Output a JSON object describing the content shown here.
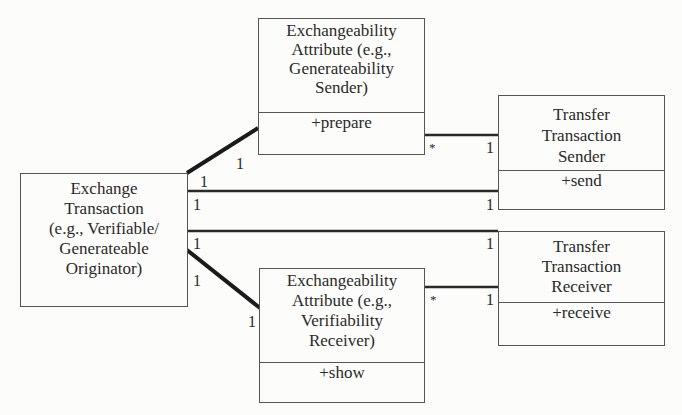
{
  "diagram": {
    "type": "uml-class",
    "classes": [
      {
        "id": "exchange_transaction",
        "name": "Exchange\nTransaction\n(e.g., Verifiable/\nGenerateable\nOriginator)",
        "operations": []
      },
      {
        "id": "attr_sender",
        "name": "Exchangeability\nAttribute (e.g.,\nGenerateability\nSender)",
        "operations": [
          "+prepare"
        ]
      },
      {
        "id": "tt_sender",
        "name": "Transfer\nTransaction\nSender",
        "operations": [
          "+send"
        ]
      },
      {
        "id": "attr_receiver",
        "name": "Exchangeability\nAttribute (e.g.,\nVerifiability\nReceiver)",
        "operations": [
          "+show"
        ]
      },
      {
        "id": "tt_receiver",
        "name": "Transfer\nTransaction\nReceiver",
        "operations": [
          "+receive"
        ]
      }
    ],
    "associations": [
      {
        "from": "exchange_transaction",
        "to": "attr_sender",
        "from_mult": "1",
        "to_mult": "1",
        "style": "thick"
      },
      {
        "from": "exchange_transaction",
        "to": "tt_sender",
        "from_mult": "1",
        "to_mult": "1",
        "style": "normal"
      },
      {
        "from": "exchange_transaction",
        "to": "tt_receiver",
        "from_mult": "1",
        "to_mult": "1",
        "style": "normal"
      },
      {
        "from": "exchange_transaction",
        "to": "attr_receiver",
        "from_mult": "1",
        "to_mult": "1",
        "style": "thick"
      },
      {
        "from": "attr_sender",
        "to": "tt_sender",
        "from_mult": "*",
        "to_mult": "1",
        "style": "normal"
      },
      {
        "from": "attr_receiver",
        "to": "tt_receiver",
        "from_mult": "*",
        "to_mult": "1",
        "style": "normal"
      }
    ]
  }
}
